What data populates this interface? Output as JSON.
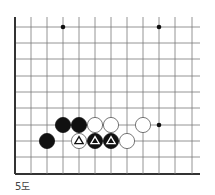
{
  "diagram": {
    "caption": "5도",
    "board": {
      "grid_x": [
        15,
        31,
        47,
        63,
        79,
        95,
        111,
        127,
        143,
        159,
        175,
        192
      ],
      "grid_y": [
        27,
        43,
        59,
        76,
        92,
        108,
        125,
        141,
        157,
        174
      ],
      "right_extent": 200,
      "left_edge_thick": true,
      "bottom_edge_thick": true,
      "line_color": "#7a7a7a",
      "edge_color": "#333333",
      "star_points": [
        {
          "col": 3,
          "row": 0
        },
        {
          "col": 9,
          "row": 0
        },
        {
          "col": 9,
          "row": 6
        }
      ],
      "stones": [
        {
          "col": 3,
          "row": 6,
          "color": "black",
          "mark": ""
        },
        {
          "col": 4,
          "row": 6,
          "color": "black",
          "mark": ""
        },
        {
          "col": 5,
          "row": 6,
          "color": "white",
          "mark": ""
        },
        {
          "col": 6,
          "row": 6,
          "color": "white",
          "mark": ""
        },
        {
          "col": 8,
          "row": 6,
          "color": "white",
          "mark": ""
        },
        {
          "col": 2,
          "row": 7,
          "color": "black",
          "mark": ""
        },
        {
          "col": 4,
          "row": 7,
          "color": "white",
          "mark": "triangle"
        },
        {
          "col": 5,
          "row": 7,
          "color": "black",
          "mark": "triangle"
        },
        {
          "col": 6,
          "row": 7,
          "color": "black",
          "mark": "triangle"
        },
        {
          "col": 7,
          "row": 7,
          "color": "white",
          "mark": ""
        }
      ]
    }
  }
}
